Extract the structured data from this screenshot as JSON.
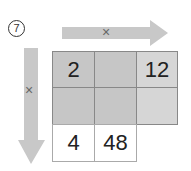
{
  "problem": {
    "number": "7"
  },
  "arrows": {
    "horizontal": {
      "label": "×"
    },
    "vertical": {
      "label": "×"
    }
  },
  "grid": {
    "rows": [
      [
        "2",
        "",
        "12"
      ],
      [
        "",
        "",
        ""
      ],
      [
        "4",
        "48"
      ]
    ]
  }
}
